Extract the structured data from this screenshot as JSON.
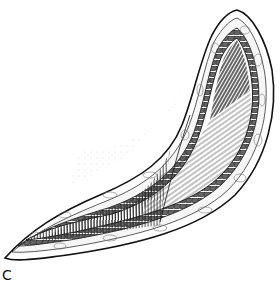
{
  "figure": {
    "style": "black and white pen-and-ink",
    "layers": [
      "skin edge",
      "fat layer",
      "fascia border",
      "muscle fibers"
    ],
    "colors": {
      "ink": "#111111",
      "paper": "#ffffff",
      "shade": "#555555"
    },
    "label": "C"
  }
}
